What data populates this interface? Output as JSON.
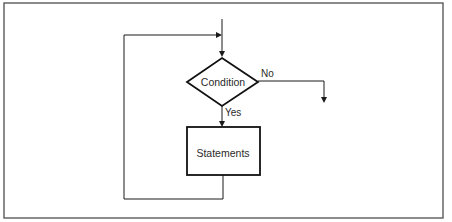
{
  "diagram": {
    "type": "flowchart",
    "frame": {
      "x": 4,
      "y": 3,
      "width": 439,
      "height": 215,
      "stroke": "#555555"
    },
    "nodes": {
      "condition": {
        "shape": "diamond",
        "label": "Condition",
        "cx": 222,
        "cy": 82,
        "half_w": 35,
        "half_h": 24
      },
      "statements": {
        "shape": "rectangle",
        "label": "Statements",
        "x": 187,
        "y": 127,
        "width": 73,
        "height": 48
      }
    },
    "edges": [
      {
        "from": "entry",
        "to": "condition",
        "label": ""
      },
      {
        "from": "condition",
        "to": "exit",
        "label": "No"
      },
      {
        "from": "condition",
        "to": "statements",
        "label": "Yes"
      },
      {
        "from": "statements",
        "to": "condition",
        "label": "",
        "kind": "loop-back"
      }
    ],
    "edge_labels": {
      "no": "No",
      "yes": "Yes"
    },
    "colors": {
      "line": "#1a1a1a",
      "text": "#2a2a2a",
      "background": "#ffffff"
    }
  }
}
